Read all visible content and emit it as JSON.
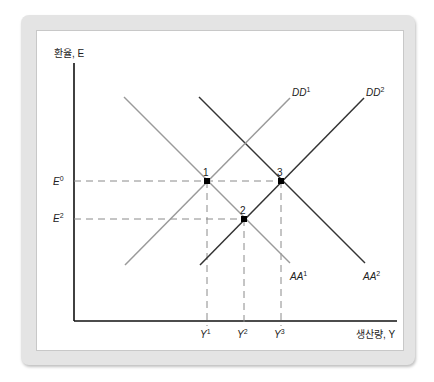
{
  "diagram": {
    "y_axis_label": "환율, E",
    "x_axis_label": "생산량, Y",
    "y_ticks": [
      {
        "base": "E",
        "sup": "0"
      },
      {
        "base": "E",
        "sup": "2"
      }
    ],
    "x_ticks": [
      {
        "base": "Y",
        "sup": "1"
      },
      {
        "base": "Y",
        "sup": "2"
      },
      {
        "base": "Y",
        "sup": "3"
      }
    ],
    "curves": [
      {
        "name": "DD",
        "sup": "1",
        "color": "#9a9a9a"
      },
      {
        "name": "DD",
        "sup": "2",
        "color": "#333333"
      },
      {
        "name": "AA",
        "sup": "1",
        "color": "#9a9a9a"
      },
      {
        "name": "AA",
        "sup": "2",
        "color": "#333333"
      }
    ],
    "points": [
      "1",
      "2",
      "3"
    ],
    "colors": {
      "axis": "#111111",
      "dashed": "#8a8a8a",
      "frame": "#e4e4e4"
    }
  }
}
